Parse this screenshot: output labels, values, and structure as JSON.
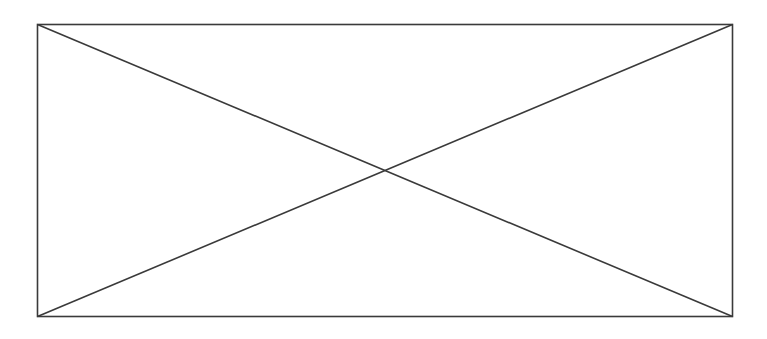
{
  "diagram": {
    "kind": "placeholder-box-with-x",
    "stroke_color": "#3a3a3a",
    "background_color": "#ffffff"
  }
}
